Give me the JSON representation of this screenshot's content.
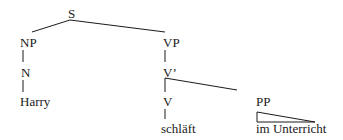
{
  "diagram": {
    "type": "syntax-tree",
    "nodes": {
      "s": "S",
      "np": "NP",
      "n": "N",
      "harry": "Harry",
      "vp": "VP",
      "vbar": "V’",
      "v": "V",
      "schlaeft": "schläft",
      "pp": "PP",
      "im_unterricht": "im Unterricht"
    },
    "line_color": "#1a1a1a"
  }
}
